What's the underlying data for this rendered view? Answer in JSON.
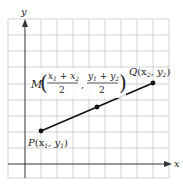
{
  "diagram": {
    "axes": {
      "x_label": "x",
      "y_label": "y"
    },
    "colors": {
      "grid": "#c8c8c8",
      "axis": "#333333",
      "segment": "#111111",
      "text": "#222222"
    },
    "points": {
      "P": {
        "name": "P",
        "label": "P(x₁, y₁)",
        "coord_text": "(x",
        "sub1": "1",
        "sep": ", y",
        "sub2": "1",
        "close": ")"
      },
      "Q": {
        "name": "Q",
        "label": "Q(x₂, y₂)",
        "coord_text": "(x",
        "sub1": "2",
        "sep": ", y",
        "sub2": "2",
        "close": ")"
      },
      "M": {
        "name": "M",
        "num1_a": "x",
        "num1_a_sub": "1",
        "num1_op": " + ",
        "num1_b": "x",
        "num1_b_sub": "2",
        "num2_a": "y",
        "num2_a_sub": "1",
        "num2_op": " + ",
        "num2_b": "y",
        "num2_b_sub": "2",
        "den": "2",
        "comma": ","
      }
    }
  }
}
